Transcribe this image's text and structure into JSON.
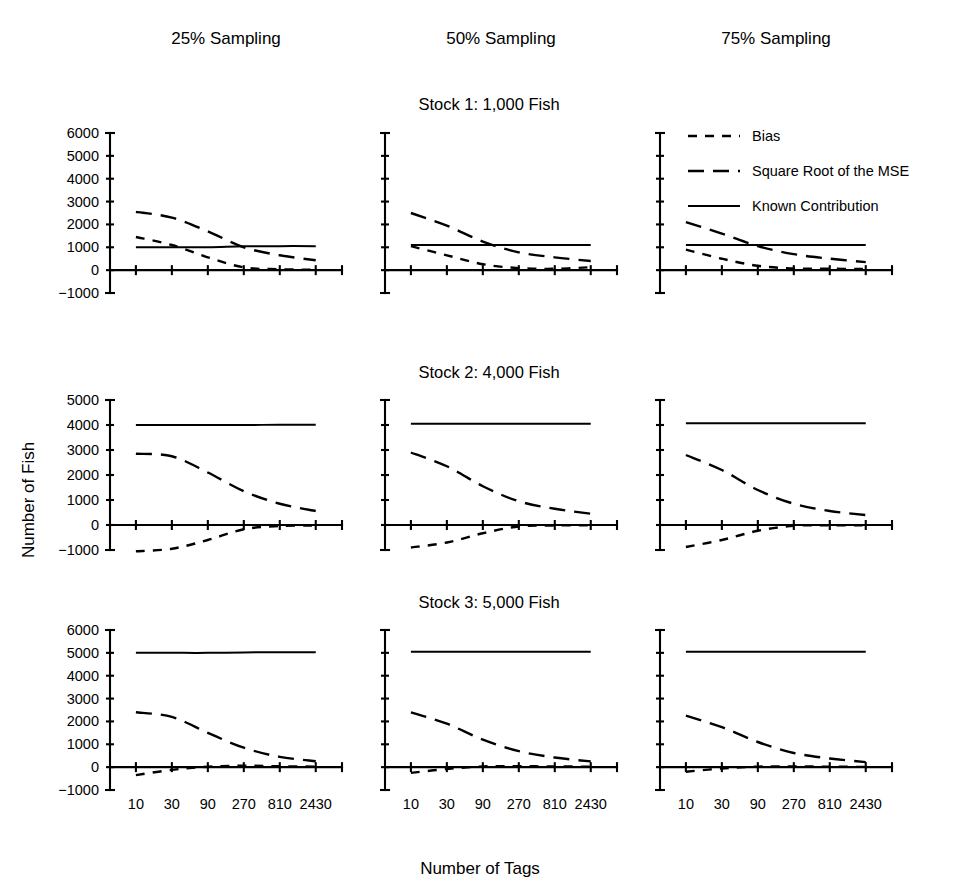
{
  "figure": {
    "column_titles": [
      "25% Sampling",
      "50% Sampling",
      "75% Sampling"
    ],
    "row_titles": [
      "Stock 1:  1,000 Fish",
      "Stock 2:  4,000 Fish",
      "Stock 3:  5,000 Fish"
    ],
    "x_axis_title": "Number of Tags",
    "y_axis_title": "Number of  Fish",
    "legend": {
      "items": [
        {
          "label": "Bias",
          "style": "short-dash",
          "color": "#000000"
        },
        {
          "label": "Square Root of the MSE",
          "style": "long-dash",
          "color": "#000000"
        },
        {
          "label": "Known Contribution",
          "style": "solid",
          "color": "#000000"
        }
      ]
    },
    "x_tick_labels": [
      "10",
      "30",
      "90",
      "270",
      "810",
      "2430"
    ]
  },
  "chart_data": [
    {
      "type": "line",
      "title": "Stock 1:  1,000 Fish",
      "panel": "25% Sampling",
      "xlabel": "Number of Tags",
      "ylabel": "Number of  Fish",
      "x": [
        10,
        30,
        90,
        270,
        810,
        2430
      ],
      "x_scale": "log3",
      "ylim": [
        -1000,
        6000
      ],
      "yticks": [
        -1000,
        0,
        1000,
        2000,
        3000,
        4000,
        5000,
        6000
      ],
      "ytick_labels": [
        "-1000",
        "0",
        "1000",
        "2000",
        "3000",
        "4000",
        "5000",
        "6000"
      ],
      "grid": false,
      "legend_position": "top-right-of-figure",
      "series": [
        {
          "name": "Known Contribution",
          "style": "solid",
          "values": [
            1000,
            1000,
            1000,
            1040,
            1050,
            1050
          ]
        },
        {
          "name": "Square Root of the MSE",
          "style": "long-dash",
          "values": [
            2550,
            2300,
            1700,
            1000,
            650,
            430
          ]
        },
        {
          "name": "Bias",
          "style": "short-dash",
          "values": [
            1450,
            1100,
            560,
            120,
            40,
            20
          ]
        }
      ]
    },
    {
      "type": "line",
      "title": "Stock 1:  1,000 Fish",
      "panel": "50% Sampling",
      "xlabel": "Number of Tags",
      "ylabel": "Number of  Fish",
      "x": [
        10,
        30,
        90,
        270,
        810,
        2430
      ],
      "x_scale": "log3",
      "ylim": [
        -1000,
        6000
      ],
      "yticks": [
        -1000,
        0,
        1000,
        2000,
        3000,
        4000,
        5000,
        6000
      ],
      "ytick_labels": [
        "-1000",
        "0",
        "1000",
        "2000",
        "3000",
        "4000",
        "5000",
        "6000"
      ],
      "grid": false,
      "series": [
        {
          "name": "Known Contribution",
          "style": "solid",
          "values": [
            1100,
            1100,
            1100,
            1100,
            1100,
            1100
          ]
        },
        {
          "name": "Square Root of the MSE",
          "style": "long-dash",
          "values": [
            2500,
            1950,
            1250,
            780,
            560,
            400
          ]
        },
        {
          "name": "Bias",
          "style": "short-dash",
          "values": [
            1050,
            650,
            260,
            90,
            60,
            130
          ]
        }
      ]
    },
    {
      "type": "line",
      "title": "Stock 1:  1,000 Fish",
      "panel": "75% Sampling",
      "xlabel": "Number of Tags",
      "ylabel": "Number of  Fish",
      "x": [
        10,
        30,
        90,
        270,
        810,
        2430
      ],
      "x_scale": "log3",
      "ylim": [
        -1000,
        6000
      ],
      "yticks": [
        -1000,
        0,
        1000,
        2000,
        3000,
        4000,
        5000,
        6000
      ],
      "ytick_labels": [
        "-1000",
        "0",
        "1000",
        "2000",
        "3000",
        "4000",
        "5000",
        "6000"
      ],
      "grid": false,
      "series": [
        {
          "name": "Known Contribution",
          "style": "solid",
          "values": [
            1100,
            1100,
            1100,
            1100,
            1100,
            1100
          ]
        },
        {
          "name": "Square Root of the MSE",
          "style": "long-dash",
          "values": [
            2100,
            1600,
            1050,
            700,
            500,
            350
          ]
        },
        {
          "name": "Bias",
          "style": "short-dash",
          "values": [
            900,
            500,
            190,
            70,
            60,
            50
          ]
        }
      ]
    },
    {
      "type": "line",
      "title": "Stock 2:  4,000 Fish",
      "panel": "25% Sampling",
      "xlabel": "Number of Tags",
      "ylabel": "Number of  Fish",
      "x": [
        10,
        30,
        90,
        270,
        810,
        2430
      ],
      "x_scale": "log3",
      "ylim": [
        -1000,
        5000
      ],
      "yticks": [
        -1000,
        0,
        1000,
        2000,
        3000,
        4000,
        5000
      ],
      "ytick_labels": [
        "-1000",
        "0",
        "1000",
        "2000",
        "3000",
        "4000",
        "5000"
      ],
      "grid": false,
      "series": [
        {
          "name": "Known Contribution",
          "style": "solid",
          "values": [
            4000,
            4000,
            4000,
            4000,
            4010,
            4010
          ]
        },
        {
          "name": "Square Root of the MSE",
          "style": "long-dash",
          "values": [
            2850,
            2750,
            2100,
            1350,
            850,
            560
          ]
        },
        {
          "name": "Bias",
          "style": "short-dash",
          "values": [
            -1050,
            -950,
            -600,
            -170,
            -40,
            -20
          ]
        }
      ]
    },
    {
      "type": "line",
      "title": "Stock 2:  4,000 Fish",
      "panel": "50% Sampling",
      "xlabel": "Number of Tags",
      "ylabel": "Number of  Fish",
      "x": [
        10,
        30,
        90,
        270,
        810,
        2430
      ],
      "x_scale": "log3",
      "ylim": [
        -1000,
        5000
      ],
      "yticks": [
        -1000,
        0,
        1000,
        2000,
        3000,
        4000,
        5000
      ],
      "ytick_labels": [
        "-1000",
        "0",
        "1000",
        "2000",
        "3000",
        "4000",
        "5000"
      ],
      "grid": false,
      "series": [
        {
          "name": "Known Contribution",
          "style": "solid",
          "values": [
            4050,
            4050,
            4050,
            4050,
            4050,
            4050
          ]
        },
        {
          "name": "Square Root of the MSE",
          "style": "long-dash",
          "values": [
            2900,
            2350,
            1550,
            950,
            650,
            450
          ]
        },
        {
          "name": "Bias",
          "style": "short-dash",
          "values": [
            -900,
            -700,
            -330,
            -60,
            -20,
            -10
          ]
        }
      ]
    },
    {
      "type": "line",
      "title": "Stock 2:  4,000 Fish",
      "panel": "75% Sampling",
      "xlabel": "Number of Tags",
      "ylabel": "Number of  Fish",
      "x": [
        10,
        30,
        90,
        270,
        810,
        2430
      ],
      "x_scale": "log3",
      "ylim": [
        -1000,
        5000
      ],
      "yticks": [
        -1000,
        0,
        1000,
        2000,
        3000,
        4000,
        5000
      ],
      "ytick_labels": [
        "-1000",
        "0",
        "1000",
        "2000",
        "3000",
        "4000",
        "5000"
      ],
      "grid": false,
      "series": [
        {
          "name": "Known Contribution",
          "style": "solid",
          "values": [
            4070,
            4070,
            4070,
            4070,
            4070,
            4070
          ]
        },
        {
          "name": "Square Root of the MSE",
          "style": "long-dash",
          "values": [
            2800,
            2200,
            1400,
            850,
            560,
            400
          ]
        },
        {
          "name": "Bias",
          "style": "short-dash",
          "values": [
            -880,
            -600,
            -230,
            -30,
            -10,
            -10
          ]
        }
      ]
    },
    {
      "type": "line",
      "title": "Stock 3:  5,000 Fish",
      "panel": "25% Sampling",
      "xlabel": "Number of Tags",
      "ylabel": "Number of  Fish",
      "x": [
        10,
        30,
        90,
        270,
        810,
        2430
      ],
      "x_scale": "log3",
      "ylim": [
        -1000,
        6000
      ],
      "yticks": [
        -1000,
        0,
        1000,
        2000,
        3000,
        4000,
        5000,
        6000
      ],
      "ytick_labels": [
        "-1000",
        "0",
        "1000",
        "2000",
        "3000",
        "4000",
        "5000",
        "6000"
      ],
      "grid": false,
      "series": [
        {
          "name": "Known Contribution",
          "style": "solid",
          "values": [
            5000,
            5000,
            5000,
            5020,
            5030,
            5030
          ]
        },
        {
          "name": "Square Root of the MSE",
          "style": "long-dash",
          "values": [
            2400,
            2200,
            1500,
            850,
            450,
            260
          ]
        },
        {
          "name": "Bias",
          "style": "short-dash",
          "values": [
            -350,
            -120,
            20,
            60,
            40,
            20
          ]
        }
      ]
    },
    {
      "type": "line",
      "title": "Stock 3:  5,000 Fish",
      "panel": "50% Sampling",
      "xlabel": "Number of Tags",
      "ylabel": "Number of  Fish",
      "x": [
        10,
        30,
        90,
        270,
        810,
        2430
      ],
      "x_scale": "log3",
      "ylim": [
        -1000,
        6000
      ],
      "yticks": [
        -1000,
        0,
        1000,
        2000,
        3000,
        4000,
        5000,
        6000
      ],
      "ytick_labels": [
        "-1000",
        "0",
        "1000",
        "2000",
        "3000",
        "4000",
        "5000",
        "6000"
      ],
      "grid": false,
      "series": [
        {
          "name": "Known Contribution",
          "style": "solid",
          "values": [
            5050,
            5050,
            5050,
            5050,
            5050,
            5050
          ]
        },
        {
          "name": "Square Root of the MSE",
          "style": "long-dash",
          "values": [
            2400,
            1900,
            1200,
            700,
            420,
            250
          ]
        },
        {
          "name": "Bias",
          "style": "short-dash",
          "values": [
            -250,
            -80,
            30,
            40,
            30,
            20
          ]
        }
      ]
    },
    {
      "type": "line",
      "title": "Stock 3:  5,000 Fish",
      "panel": "75% Sampling",
      "xlabel": "Number of Tags",
      "ylabel": "Number of  Fish",
      "x": [
        10,
        30,
        90,
        270,
        810,
        2430
      ],
      "x_scale": "log3",
      "ylim": [
        -1000,
        6000
      ],
      "yticks": [
        -1000,
        0,
        1000,
        2000,
        3000,
        4000,
        5000,
        6000
      ],
      "ytick_labels": [
        "-1000",
        "0",
        "1000",
        "2000",
        "3000",
        "4000",
        "5000",
        "6000"
      ],
      "grid": false,
      "series": [
        {
          "name": "Known Contribution",
          "style": "solid",
          "values": [
            5050,
            5050,
            5050,
            5050,
            5050,
            5050
          ]
        },
        {
          "name": "Square Root of the MSE",
          "style": "long-dash",
          "values": [
            2250,
            1750,
            1100,
            620,
            380,
            220
          ]
        },
        {
          "name": "Bias",
          "style": "short-dash",
          "values": [
            -200,
            -60,
            20,
            30,
            20,
            10
          ]
        }
      ]
    }
  ],
  "layout": {
    "panel_x_origins": [
      110,
      385,
      660
    ],
    "panel_width": 232,
    "row_y_axis_top": [
      133,
      400,
      630
    ],
    "row_plot_height": [
      160,
      150,
      160
    ],
    "ytick_label_rows": [
      0
    ],
    "tick_count_x": 6
  }
}
